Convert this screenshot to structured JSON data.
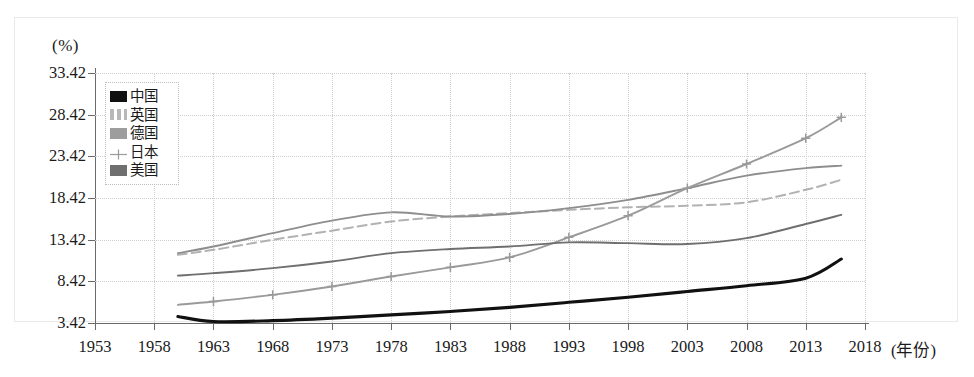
{
  "axis": {
    "unit_label": "(%)",
    "x_title": "(年份)",
    "y_ticks": [
      "3.42",
      "8.42",
      "13.42",
      "18.42",
      "23.42",
      "28.42",
      "33.42"
    ],
    "x_ticks": [
      "1953",
      "1958",
      "1963",
      "1968",
      "1973",
      "1978",
      "1983",
      "1988",
      "1993",
      "1998",
      "2003",
      "2008",
      "2013",
      "2018"
    ]
  },
  "legend": {
    "items": [
      {
        "label": "中国",
        "key": "china-key",
        "color": "#111111"
      },
      {
        "label": "英国",
        "key": "uk-key",
        "color": "#b2b2b2"
      },
      {
        "label": "德国",
        "key": "germany-key",
        "color": "#8e8e8e"
      },
      {
        "label": "日本",
        "key": "japan-key",
        "color": "#9a9a9a"
      },
      {
        "label": "美国",
        "key": "usa-key",
        "color": "#6f6f6f"
      }
    ]
  },
  "chart_data": {
    "type": "line",
    "title": "",
    "xlabel": "(年份)",
    "ylabel": "(%)",
    "xlim": [
      1953,
      2018
    ],
    "ylim": [
      3.42,
      33.42
    ],
    "grid": true,
    "legend_position": "top-left",
    "x": [
      1960,
      1963,
      1968,
      1973,
      1978,
      1983,
      1988,
      1993,
      1998,
      2003,
      2008,
      2013,
      2016
    ],
    "series": [
      {
        "name": "中国",
        "color": "#111111",
        "style": "solid-thick",
        "values": [
          4.2,
          3.6,
          3.7,
          4.0,
          4.4,
          4.8,
          5.3,
          5.9,
          6.5,
          7.2,
          7.9,
          8.8,
          11.1
        ]
      },
      {
        "name": "英国",
        "color": "#b2b2b2",
        "style": "dashed",
        "values": [
          11.6,
          12.2,
          13.4,
          14.5,
          15.6,
          16.2,
          16.6,
          17.0,
          17.3,
          17.5,
          17.9,
          19.4,
          20.6
        ]
      },
      {
        "name": "德国",
        "color": "#8e8e8e",
        "style": "solid",
        "values": [
          11.8,
          12.6,
          14.2,
          15.7,
          16.7,
          16.2,
          16.5,
          17.2,
          18.2,
          19.6,
          21.1,
          22.0,
          22.3
        ]
      },
      {
        "name": "日本",
        "color": "#9a9a9a",
        "style": "solid-plus",
        "values": [
          5.6,
          6.0,
          6.8,
          7.8,
          9.0,
          10.1,
          11.3,
          13.7,
          16.3,
          19.6,
          22.5,
          25.6,
          28.1
        ]
      },
      {
        "name": "美国",
        "color": "#6f6f6f",
        "style": "solid",
        "values": [
          9.1,
          9.4,
          10.0,
          10.8,
          11.8,
          12.3,
          12.6,
          13.1,
          13.0,
          12.9,
          13.6,
          15.3,
          16.4
        ]
      }
    ]
  }
}
